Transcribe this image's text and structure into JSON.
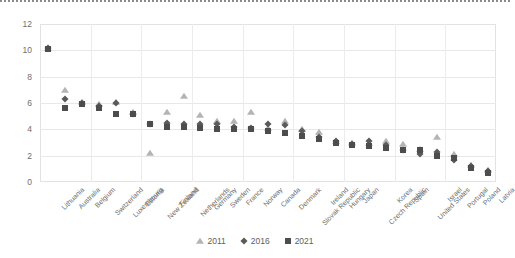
{
  "chart_data": {
    "type": "scatter",
    "title": "",
    "xlabel": "",
    "ylabel": "",
    "ylim": [
      0,
      12
    ],
    "yticks": [
      0,
      2,
      4,
      6,
      8,
      10,
      12
    ],
    "grid": true,
    "legend_position": "bottom",
    "categories": [
      "Lithuania",
      "Australia",
      "Belgium",
      "Switzerland",
      "Luxembourg",
      "Estonia",
      "New Zealand",
      "Finland",
      "Netherlands",
      "Germany",
      "Sweden",
      "France",
      "Norway",
      "Canada",
      "Denmark",
      "Slovak Republic",
      "Ireland",
      "Hungary",
      "Japan",
      "Czech Republic",
      "Korea",
      "Spain",
      "United States",
      "Israel",
      "Portugal",
      "Poland",
      "Latvia"
    ],
    "series": [
      {
        "name": "2011",
        "marker": "triangle",
        "color": "#b4b4b4",
        "values": [
          10.2,
          7.0,
          6.1,
          5.9,
          6.1,
          5.3,
          2.2,
          5.3,
          6.5,
          5.1,
          4.6,
          4.6,
          5.3,
          4.1,
          4.6,
          4.0,
          3.8,
          3.1,
          3.0,
          3.0,
          3.1,
          2.9,
          2.5,
          3.4,
          2.1,
          1.3,
          0.9
        ]
      },
      {
        "name": "2016",
        "marker": "diamond",
        "color": "#5a5a5a",
        "values": [
          10.2,
          6.3,
          6.0,
          5.8,
          6.0,
          5.2,
          4.4,
          4.5,
          4.4,
          4.4,
          4.4,
          4.2,
          4.1,
          4.4,
          4.3,
          3.9,
          3.4,
          3.1,
          2.9,
          3.1,
          2.8,
          2.4,
          2.1,
          2.3,
          1.7,
          1.2,
          0.8
        ]
      },
      {
        "name": "2021",
        "marker": "square",
        "color": "#4d4d4d",
        "values": [
          10.1,
          5.6,
          5.9,
          5.6,
          5.2,
          5.2,
          4.4,
          4.2,
          4.2,
          4.1,
          4.0,
          4.0,
          4.0,
          3.9,
          3.7,
          3.5,
          3.3,
          3.0,
          2.8,
          2.7,
          2.6,
          2.4,
          2.4,
          2.0,
          1.8,
          1.1,
          0.7
        ]
      }
    ]
  },
  "axis": {
    "y_tick_labels": [
      "12",
      "10",
      "8",
      "6",
      "4",
      "2",
      "0"
    ]
  },
  "legend": {
    "items": [
      {
        "label": "2011",
        "marker": "triangle-marker"
      },
      {
        "label": "2016",
        "marker": "diamond-marker"
      },
      {
        "label": "2021",
        "marker": "square-marker"
      }
    ]
  }
}
